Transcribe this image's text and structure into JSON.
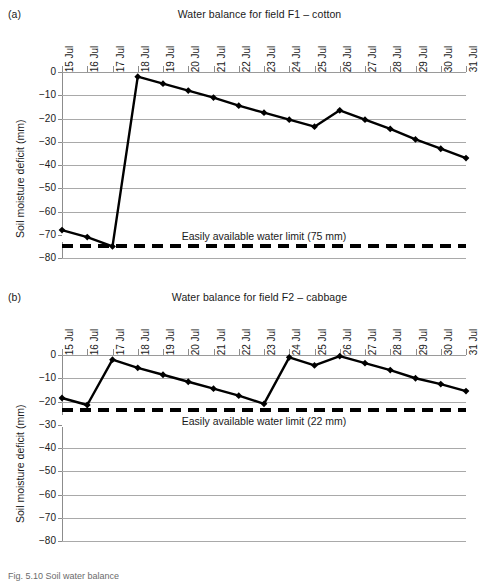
{
  "figure": {
    "panel_a_label": "(a)",
    "panel_b_label": "(b)",
    "y_axis_title": "Soil moisture deficit (mm)",
    "caption": "Fig. 5.10  Soil water balance"
  },
  "chart_data": [
    {
      "type": "line",
      "panel": "(a)",
      "title": "Water balance for field F1 – cotton",
      "xlabel": "",
      "ylabel": "Soil moisture deficit (mm)",
      "ylim": [
        -80,
        0
      ],
      "yticks": [
        0,
        -10,
        -20,
        -30,
        -40,
        -50,
        -60,
        -70,
        -80
      ],
      "ytick_labels": [
        "0",
        "−10",
        "−20",
        "−30",
        "−40",
        "−50",
        "−60",
        "−70",
        "−80"
      ],
      "grid": true,
      "legend": "none",
      "categories": [
        "15 Jul",
        "16 Jul",
        "17 Jul",
        "18 Jul",
        "19 Jul",
        "20 Jul",
        "21 Jul",
        "22 Jul",
        "23 Jul",
        "24 Jul",
        "25 Jul",
        "26 Jul",
        "27 Jul",
        "28 Jul",
        "29 Jul",
        "30 Jul",
        "31 Jul"
      ],
      "series": [
        {
          "name": "Soil moisture deficit",
          "marker": "diamond",
          "color": "#000000",
          "values": [
            -68,
            -71,
            -75,
            -2,
            -5,
            -8,
            -11,
            -14.5,
            -17.5,
            -20.5,
            -23.5,
            -16.5,
            -20.5,
            -24.5,
            -29,
            -33,
            -37
          ]
        }
      ],
      "annotations": [
        {
          "name": "easily-available-water-limit",
          "text": "Easily available water limit (75 mm)",
          "value": -75,
          "style": "dashed",
          "color": "#000000"
        }
      ]
    },
    {
      "type": "line",
      "panel": "(b)",
      "title": "Water balance for field F2 – cabbage",
      "xlabel": "",
      "ylabel": "Soil moisture deficit (mm)",
      "ylim": [
        -80,
        0
      ],
      "yticks": [
        0,
        -10,
        -20,
        -30,
        -40,
        -50,
        -60,
        -70,
        -80
      ],
      "ytick_labels": [
        "0",
        "−10",
        "−20",
        "−30",
        "−40",
        "−50",
        "−60",
        "−70",
        "−80"
      ],
      "grid": true,
      "legend": "none",
      "categories": [
        "15 Jul",
        "16 Jul",
        "17 Jul",
        "18 Jul",
        "19 Jul",
        "20 Jul",
        "21 Jul",
        "22 Jul",
        "23 Jul",
        "24 Jul",
        "25 Jul",
        "26 Jul",
        "27 Jul",
        "28 Jul",
        "29 Jul",
        "30 Jul",
        "31 Jul"
      ],
      "series": [
        {
          "name": "Soil moisture deficit",
          "marker": "diamond",
          "color": "#000000",
          "values": [
            -18.5,
            -21.5,
            -2,
            -5.5,
            -8.5,
            -11.5,
            -14.5,
            -17.5,
            -21,
            -1,
            -4.5,
            -0.5,
            -3.5,
            -6.5,
            -10,
            -12.5,
            -15.5
          ]
        }
      ],
      "annotations": [
        {
          "name": "easily-available-water-limit",
          "text": "Easily available water limit (22 mm)",
          "value": -23.5,
          "style": "dashed",
          "color": "#000000"
        }
      ]
    }
  ]
}
